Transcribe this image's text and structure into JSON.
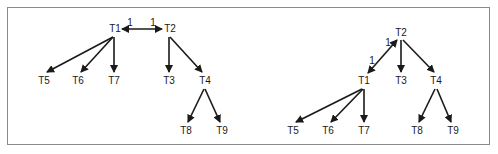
{
  "diagrams": [
    {
      "name": "left-tree",
      "nodes": [
        {
          "id": "T1",
          "label": "T1",
          "x": 115,
          "y": 29
        },
        {
          "id": "T2",
          "label": "T2",
          "x": 170,
          "y": 29
        },
        {
          "id": "T5",
          "label": "T5",
          "x": 44,
          "y": 81
        },
        {
          "id": "T6",
          "label": "T6",
          "x": 78,
          "y": 81
        },
        {
          "id": "T7",
          "label": "T7",
          "x": 114,
          "y": 81
        },
        {
          "id": "T3",
          "label": "T3",
          "x": 169,
          "y": 81
        },
        {
          "id": "T4",
          "label": "T4",
          "x": 205,
          "y": 81
        },
        {
          "id": "T8",
          "label": "T8",
          "x": 186,
          "y": 131
        },
        {
          "id": "T9",
          "label": "T9",
          "x": 222,
          "y": 131
        }
      ],
      "edges": [
        {
          "from": "T1",
          "to": "T2",
          "type": "bidirectional",
          "x1": 122,
          "y1": 29,
          "x2": 162,
          "y2": 29
        },
        {
          "from": "T1",
          "to": "T5",
          "x1": 113,
          "y1": 37,
          "x2": 47,
          "y2": 72
        },
        {
          "from": "T1",
          "to": "T6",
          "x1": 113,
          "y1": 37,
          "x2": 81,
          "y2": 72
        },
        {
          "from": "T1",
          "to": "T7",
          "x1": 114,
          "y1": 37,
          "x2": 114,
          "y2": 72
        },
        {
          "from": "T2",
          "to": "T3",
          "x1": 169,
          "y1": 37,
          "x2": 169,
          "y2": 72
        },
        {
          "from": "T2",
          "to": "T4",
          "x1": 170,
          "y1": 37,
          "x2": 202,
          "y2": 72
        },
        {
          "from": "T4",
          "to": "T8",
          "x1": 204,
          "y1": 89,
          "x2": 188,
          "y2": 122
        },
        {
          "from": "T4",
          "to": "T9",
          "x1": 205,
          "y1": 89,
          "x2": 220,
          "y2": 122
        }
      ],
      "edge_labels": [
        {
          "text": "1",
          "x": 130,
          "y": 23
        },
        {
          "text": "1",
          "x": 153,
          "y": 23
        }
      ]
    },
    {
      "name": "right-tree",
      "nodes": [
        {
          "id": "T2",
          "label": "T2",
          "x": 401,
          "y": 33
        },
        {
          "id": "T1",
          "label": "T1",
          "x": 364,
          "y": 81
        },
        {
          "id": "T3",
          "label": "T3",
          "x": 401,
          "y": 81
        },
        {
          "id": "T4",
          "label": "T4",
          "x": 436,
          "y": 81
        },
        {
          "id": "T5",
          "label": "T5",
          "x": 293,
          "y": 131
        },
        {
          "id": "T6",
          "label": "T6",
          "x": 328,
          "y": 131
        },
        {
          "id": "T7",
          "label": "T7",
          "x": 364,
          "y": 131
        },
        {
          "id": "T8",
          "label": "T8",
          "x": 417,
          "y": 131
        },
        {
          "id": "T9",
          "label": "T9",
          "x": 453,
          "y": 131
        }
      ],
      "edges": [
        {
          "from": "T1",
          "to": "T2",
          "type": "bidirectional",
          "x1": 368,
          "y1": 73,
          "x2": 397,
          "y2": 40
        },
        {
          "from": "T2",
          "to": "T3",
          "x1": 401,
          "y1": 40,
          "x2": 401,
          "y2": 72
        },
        {
          "from": "T2",
          "to": "T4",
          "x1": 403,
          "y1": 40,
          "x2": 434,
          "y2": 72
        },
        {
          "from": "T1",
          "to": "T5",
          "x1": 362,
          "y1": 89,
          "x2": 296,
          "y2": 122
        },
        {
          "from": "T1",
          "to": "T6",
          "x1": 363,
          "y1": 89,
          "x2": 331,
          "y2": 122
        },
        {
          "from": "T1",
          "to": "T7",
          "x1": 364,
          "y1": 89,
          "x2": 364,
          "y2": 122
        },
        {
          "from": "T4",
          "to": "T8",
          "x1": 435,
          "y1": 89,
          "x2": 419,
          "y2": 122
        },
        {
          "from": "T4",
          "to": "T9",
          "x1": 437,
          "y1": 89,
          "x2": 451,
          "y2": 122
        }
      ],
      "edge_labels": [
        {
          "text": "1",
          "x": 388,
          "y": 43
        },
        {
          "text": "1",
          "x": 372,
          "y": 61
        }
      ]
    }
  ],
  "colors": {
    "stroke": "#1a1a1a",
    "border": "#8a8a8a",
    "background": "#ffffff"
  }
}
